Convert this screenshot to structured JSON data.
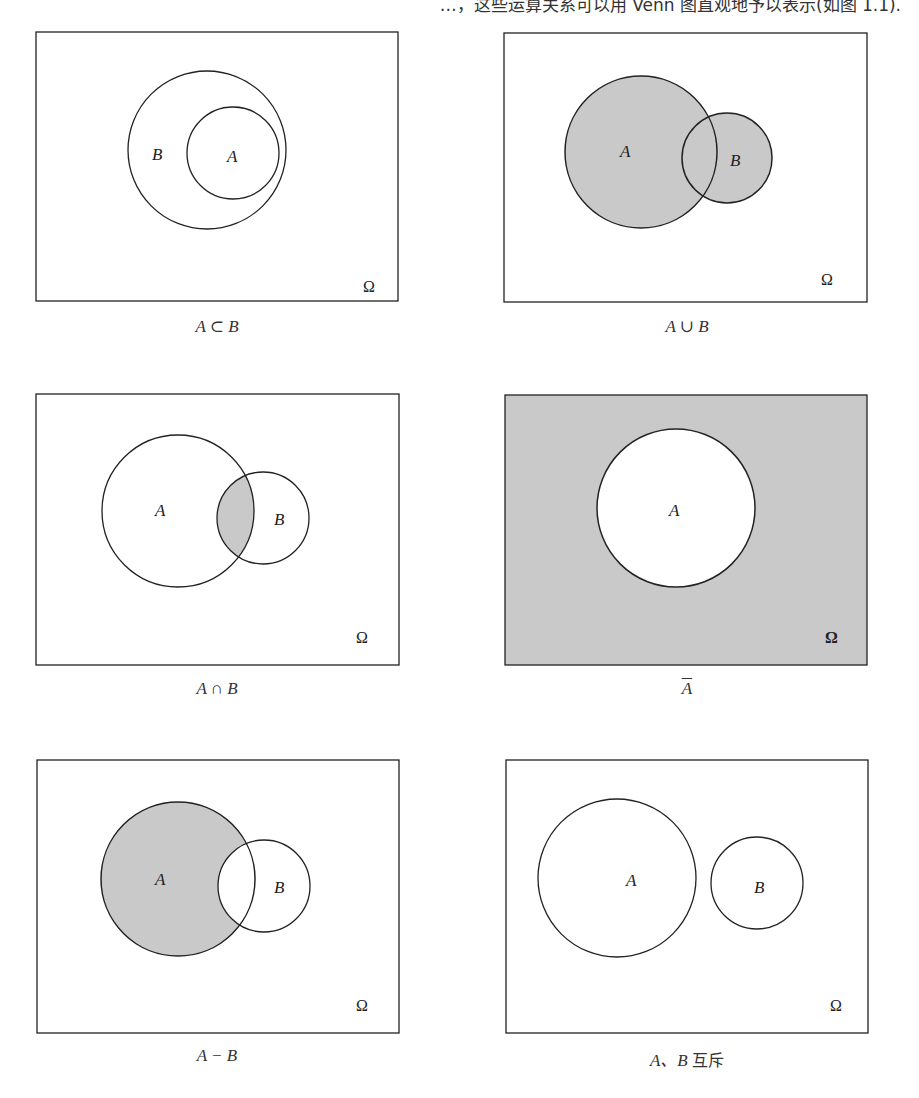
{
  "top_text_partial": "…，这些运算关系可以用 Venn 图直观地予以表示(如图 1.1).",
  "colors": {
    "shade": "#c9c9c9",
    "stroke": "#222222",
    "background": "#ffffff"
  },
  "universe_label": "Ω",
  "panels": [
    {
      "id": "subset",
      "caption": "A ⊂ B",
      "box": {
        "x": 36,
        "y": 32,
        "w": 362,
        "h": 269
      },
      "circles": [
        {
          "name": "B",
          "cx": 207,
          "cy": 150,
          "r": 79,
          "fill": "none"
        },
        {
          "name": "A",
          "cx": 233,
          "cy": 153,
          "r": 46,
          "fill": "none"
        }
      ],
      "labels": [
        {
          "text": "B",
          "x": 159,
          "y": 160
        },
        {
          "text": "A",
          "x": 233,
          "y": 162
        }
      ],
      "shaded": "none"
    },
    {
      "id": "union",
      "caption": "A ∪ B",
      "box": {
        "x": 504,
        "y": 33,
        "w": 363,
        "h": 269
      },
      "circles": [
        {
          "name": "A",
          "cx": 641,
          "cy": 152,
          "r": 76,
          "fill": "shade"
        },
        {
          "name": "B",
          "cx": 727,
          "cy": 158,
          "r": 45,
          "fill": "shade"
        }
      ],
      "labels": [
        {
          "text": "A",
          "x": 627,
          "y": 157
        },
        {
          "text": "B",
          "x": 736,
          "y": 166
        }
      ],
      "shaded": "A ∪ B"
    },
    {
      "id": "intersection",
      "caption": "A ∩ B",
      "box": {
        "x": 36,
        "y": 394,
        "w": 363,
        "h": 271
      },
      "circles": [
        {
          "name": "A",
          "cx": 178,
          "cy": 511,
          "r": 76,
          "fill": "none"
        },
        {
          "name": "B",
          "cx": 263,
          "cy": 518,
          "r": 46,
          "fill": "none"
        }
      ],
      "labels": [
        {
          "text": "A",
          "x": 162,
          "y": 516
        },
        {
          "text": "B",
          "x": 281,
          "y": 525
        }
      ],
      "shaded": "A ∩ B"
    },
    {
      "id": "complement",
      "caption": "A",
      "caption_overline": true,
      "box": {
        "x": 505,
        "y": 395,
        "w": 362,
        "h": 270
      },
      "circles": [
        {
          "name": "A",
          "cx": 676,
          "cy": 508,
          "r": 79,
          "fill": "white"
        }
      ],
      "labels": [
        {
          "text": "A",
          "x": 675,
          "y": 516
        }
      ],
      "shaded": "Ω − A"
    },
    {
      "id": "difference",
      "caption": "A − B",
      "box": {
        "x": 37,
        "y": 760,
        "w": 362,
        "h": 273
      },
      "circles": [
        {
          "name": "A",
          "cx": 178,
          "cy": 879,
          "r": 77,
          "fill": "shade"
        },
        {
          "name": "B",
          "cx": 264,
          "cy": 886,
          "r": 46,
          "fill": "white"
        }
      ],
      "labels": [
        {
          "text": "A",
          "x": 162,
          "y": 885
        },
        {
          "text": "B",
          "x": 281,
          "y": 893
        }
      ],
      "shaded": "A − B"
    },
    {
      "id": "disjoint",
      "caption": "A、B 互斥",
      "box": {
        "x": 506,
        "y": 760,
        "w": 362,
        "h": 273
      },
      "circles": [
        {
          "name": "A",
          "cx": 617,
          "cy": 878,
          "r": 79,
          "fill": "none"
        },
        {
          "name": "B",
          "cx": 757,
          "cy": 883,
          "r": 46,
          "fill": "none"
        }
      ],
      "labels": [
        {
          "text": "A",
          "x": 632,
          "y": 886
        },
        {
          "text": "B",
          "x": 761,
          "y": 893
        }
      ],
      "shaded": "none"
    }
  ],
  "captions": {
    "subset": "A ⊂ B",
    "union": "A ∪ B",
    "intersection": "A ∩ B",
    "complement": "A",
    "difference": "A − B",
    "disjoint_letters": "A、B",
    "disjoint_word": "互斥"
  },
  "letters": {
    "A": "A",
    "B": "B"
  }
}
